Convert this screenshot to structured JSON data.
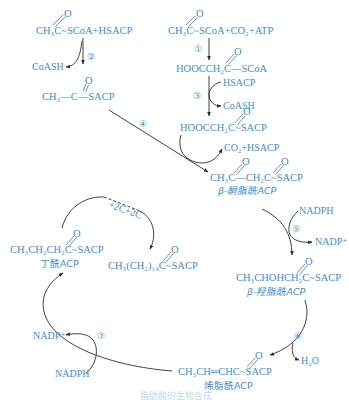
{
  "diagram": {
    "acetyl_coa_acp": {
      "oxygen": "O",
      "formula": "CH₃C~SCoA+HSACP"
    },
    "step2": {
      "label": "②",
      "byproduct": "CoASH"
    },
    "acetyl_acp": {
      "oxygen": "O",
      "formula": "CH₃—C—SACP"
    },
    "step4": {
      "label": "④"
    },
    "acetyl_coa_co2": {
      "oxygen": "O",
      "formula": "CH₃C~SCoA+CO₂+ATP"
    },
    "step1": {
      "label": "①"
    },
    "malonyl_coa": {
      "oxygen": "O",
      "formula": "HOOCCH₂C—SCoA"
    },
    "step3": {
      "label": "③",
      "input": "HSACP",
      "byproduct": "CoASH"
    },
    "malonyl_acp": {
      "oxygen": "O",
      "formula": "HOOCCH₂C~SACP"
    },
    "condensation": {
      "byproduct": "CO₂+HSACP"
    },
    "ketoacyl_acp": {
      "oxygen1": "O",
      "oxygen2": "O",
      "formula": "CH₃C—CH₂C~SACP",
      "name": "β-酮脂酰ACP"
    },
    "step5": {
      "label": "⑤",
      "input": "NADPH",
      "output": "NADP⁺"
    },
    "hydroxyacyl_acp": {
      "oxygen": "O",
      "formula": "CH₃CHOHCH₂C~SACP",
      "name": "β-羟脂酰ACP"
    },
    "step6": {
      "label": "⑥",
      "output": "H₂O"
    },
    "enoyl_acp": {
      "oxygen": "O",
      "formula": "CH₃CH═CHC~SACP",
      "name": "烯脂酰ACP"
    },
    "step7": {
      "label": "⑦",
      "input": "NADPH",
      "output": "NADP⁺"
    },
    "butyryl_acp": {
      "oxygen": "O",
      "formula": "CH₃CH₂CH₂C~SACP",
      "name": "丁酰ACP"
    },
    "elongation": {
      "label": "+2C+2C"
    },
    "palmitoyl_acp": {
      "oxygen": "O",
      "formula": "CH₃(CH₂)₁₄C~SACP"
    }
  },
  "caption": "脂肪酸的生物合成",
  "colors": {
    "text": "#3d8ed6",
    "arrows": "#2b2b2b",
    "background": "#ffffff"
  }
}
